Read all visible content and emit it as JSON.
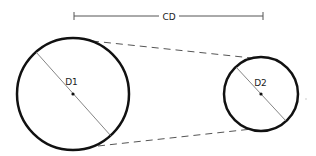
{
  "diagram": {
    "type": "belt-pulley",
    "colors": {
      "outline": "#111111",
      "thin": "#555555",
      "dash": "#555555",
      "background": "#ffffff"
    },
    "labels": {
      "center_distance": "CD",
      "pulley1_diameter": "D1",
      "pulley2_diameter": "D2"
    },
    "center_distance_bar": {
      "x1": 74,
      "x2": 263,
      "y": 16,
      "tick_height": 8,
      "gap": [
        159,
        179
      ]
    },
    "pulley1": {
      "cx": 73,
      "cy": 94,
      "r": 56
    },
    "pulley2": {
      "cx": 261,
      "cy": 94,
      "r": 37
    },
    "belt_top": {
      "x1": 92,
      "y1": 41,
      "x2": 252,
      "y2": 58
    },
    "belt_bottom": {
      "x1": 98,
      "y1": 146,
      "x2": 252,
      "y2": 129
    }
  }
}
